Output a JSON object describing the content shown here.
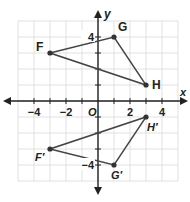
{
  "graph": {
    "axes": {
      "x_label": "x",
      "y_label": "y",
      "origin_label": "O"
    },
    "x_ticks": [
      {
        "v": -4,
        "t": "−4"
      },
      {
        "v": -2,
        "t": "−2"
      },
      {
        "v": 2,
        "t": "2"
      },
      {
        "v": 4,
        "t": "4"
      }
    ],
    "y_ticks": [
      {
        "v": 4,
        "t": "4"
      },
      {
        "v": -4,
        "t": "−4"
      }
    ],
    "range": {
      "xmin": -5,
      "xmax": 5,
      "ymin": -5,
      "ymax": 5
    },
    "colors": {
      "grid": "#d9d9d9",
      "axis": "#222222",
      "shape": "#444444",
      "point": "#333333"
    },
    "triangles": [
      {
        "name": "FGH",
        "points": [
          {
            "label": "F",
            "x": -3,
            "y": 3
          },
          {
            "label": "G",
            "x": 1,
            "y": 4
          },
          {
            "label": "H",
            "x": 3,
            "y": 1
          }
        ]
      },
      {
        "name": "F'G'H'",
        "points": [
          {
            "label": "F′",
            "x": -3,
            "y": -3
          },
          {
            "label": "G′",
            "x": 1,
            "y": -4
          },
          {
            "label": "H′",
            "x": 3,
            "y": -1
          }
        ]
      }
    ]
  }
}
